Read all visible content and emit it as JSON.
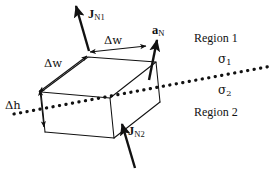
{
  "figure": {
    "background_color": "#ffffff",
    "ink_color": "#111111"
  },
  "labels": {
    "j_n1": {
      "symbol": "J",
      "subscript": "N1",
      "text": "JN1"
    },
    "j_n2": {
      "symbol": "J",
      "subscript": "N2",
      "text": "JN2"
    },
    "a_n": {
      "symbol": "a",
      "subscript": "N",
      "text": "aN"
    },
    "delta_w_top": {
      "text": "Δw"
    },
    "delta_w_left": {
      "text": "Δw"
    },
    "delta_h": {
      "text": "Δh"
    },
    "region_1": {
      "text": "Region 1"
    },
    "region_2": {
      "text": "Region 2"
    },
    "sigma_1": {
      "symbol": "σ",
      "subscript": "1",
      "text": "σ1"
    },
    "sigma_2": {
      "symbol": "σ",
      "subscript": "2",
      "text": "σ2"
    }
  },
  "geometry": {
    "interface_line": {
      "style": "dotted",
      "start": [
        14,
        114
      ],
      "end": [
        272,
        66
      ]
    },
    "pillbox": {
      "description": "rectangular parallelepiped straddling the interface",
      "top_face": [
        [
          41,
          92
        ],
        [
          88,
          57
        ],
        [
          156,
          62
        ],
        [
          110,
          98
        ]
      ],
      "height_px": 40
    },
    "arrows": {
      "j_n1": {
        "tail": [
          89,
          51
        ],
        "head": [
          76,
          4
        ]
      },
      "j_n2": {
        "tail": [
          135,
          168
        ],
        "head": [
          122,
          122
        ]
      },
      "a_n": {
        "tail": [
          150,
          80
        ],
        "head": [
          158,
          38
        ]
      },
      "delta_w_top": {
        "from": [
          88,
          52
        ],
        "to": [
          144,
          46
        ],
        "double_headed": true
      },
      "delta_w_left": {
        "from": [
          87,
          55
        ],
        "to": [
          40,
          91
        ],
        "double_headed": true
      },
      "delta_h": {
        "from": [
          41,
          90
        ],
        "to": [
          44,
          126
        ],
        "double_headed": true
      }
    }
  }
}
